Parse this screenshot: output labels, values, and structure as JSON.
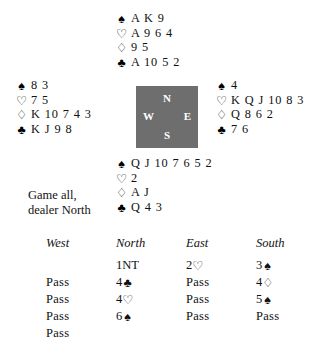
{
  "suits": {
    "spade": "♠",
    "heart": "♡",
    "diamond": "♢",
    "club": "♣"
  },
  "hands": {
    "north": {
      "label": "North",
      "spades": "A K 9",
      "hearts": "A 9 6 4",
      "diamonds": "9 5",
      "clubs": "A 10 5 2"
    },
    "west": {
      "label": "West",
      "spades": "8 3",
      "hearts": "7 5",
      "diamonds": "K 10 7 4 3",
      "clubs": "K J 9 8"
    },
    "east": {
      "label": "East",
      "spades": "4",
      "hearts": "K Q J 10 8 3",
      "diamonds": "Q 8 6 2",
      "clubs": "7 6"
    },
    "south": {
      "label": "South",
      "spades": "Q J 10 7 6 5 2",
      "hearts": "2",
      "diamonds": "A J",
      "clubs": "Q 4 3"
    }
  },
  "compass": {
    "north": "N",
    "west": "W",
    "east": "E",
    "south": "S"
  },
  "conditions": {
    "vulnerability": "Game all,",
    "dealer": "dealer North"
  },
  "auction": {
    "headers": [
      "West",
      "North",
      "East",
      "South"
    ],
    "rows": [
      [
        {
          "text": ""
        },
        {
          "level": "1NT",
          "suit": ""
        },
        {
          "level": "2",
          "suit": "♡"
        },
        {
          "level": "3",
          "suit": "♠"
        }
      ],
      [
        {
          "text": "Pass"
        },
        {
          "level": "4",
          "suit": "♣"
        },
        {
          "text": "Pass"
        },
        {
          "level": "4",
          "suit": "♢"
        }
      ],
      [
        {
          "text": "Pass"
        },
        {
          "level": "4",
          "suit": "♡"
        },
        {
          "text": "Pass"
        },
        {
          "level": "5",
          "suit": "♠"
        }
      ],
      [
        {
          "text": "Pass"
        },
        {
          "level": "6",
          "suit": "♠"
        },
        {
          "text": "Pass"
        },
        {
          "text": "Pass"
        }
      ],
      [
        {
          "text": "Pass"
        },
        {
          "text": ""
        },
        {
          "text": ""
        },
        {
          "text": ""
        }
      ]
    ]
  }
}
